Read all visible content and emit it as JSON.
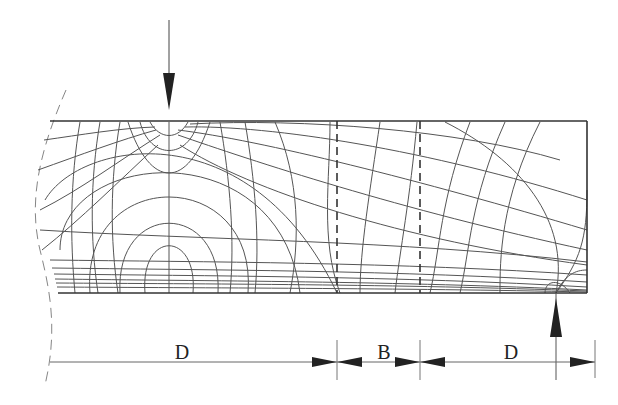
{
  "diagram": {
    "type": "stress-trajectory beam diagram",
    "load": {
      "direction": "down",
      "x": 169
    },
    "support": {
      "direction": "up",
      "x": 556
    },
    "regions": [
      {
        "id": "D1",
        "label": "D",
        "from_x": 55,
        "to_x": 337
      },
      {
        "id": "B",
        "label": "B",
        "from_x": 337,
        "to_x": 420
      },
      {
        "id": "D2",
        "label": "D",
        "from_x": 420,
        "to_x": 556
      }
    ],
    "colors": {
      "line": "#333333",
      "background": "#ffffff",
      "arrow": "#222222"
    }
  },
  "labels": {
    "d_left": "D",
    "b_middle": "B",
    "d_right": "D"
  }
}
